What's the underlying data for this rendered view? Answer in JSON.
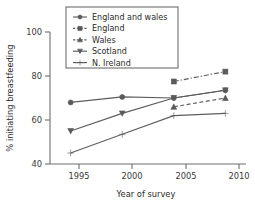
{
  "chart_data": {
    "type": "line",
    "title": "",
    "xlabel": "Year of survey",
    "ylabel": "% initiating breastfeeding",
    "x": [
      1995,
      2000,
      2005,
      2010
    ],
    "xticks": [
      "1995",
      "2000",
      "2005",
      "2010"
    ],
    "yticks": [
      "40",
      "60",
      "80",
      "100"
    ],
    "xlim": [
      1993,
      2012
    ],
    "ylim": [
      40,
      100
    ],
    "grid": false,
    "legend_position": "top-center",
    "series": [
      {
        "name": "England and wales",
        "marker": "circle",
        "linestyle": "solid",
        "color": "#5a5a5a",
        "x": [
          1995,
          2000,
          2005,
          2010
        ],
        "values": [
          68,
          70.5,
          70,
          73.5
        ]
      },
      {
        "name": "England",
        "marker": "square",
        "linestyle": "dashdot",
        "color": "#5a5a5a",
        "x": [
          2005,
          2010
        ],
        "values": [
          77.5,
          82
        ]
      },
      {
        "name": "Wales",
        "marker": "triangle-up",
        "linestyle": "dashed",
        "color": "#5a5a5a",
        "x": [
          2005,
          2010
        ],
        "values": [
          66,
          70
        ]
      },
      {
        "name": "Scotland",
        "marker": "triangle-down",
        "linestyle": "solid",
        "color": "#5a5a5a",
        "x": [
          1995,
          2000,
          2005,
          2010
        ],
        "values": [
          55,
          63,
          70,
          73.5
        ]
      },
      {
        "name": "N. Ireland",
        "marker": "plus",
        "linestyle": "solid",
        "color": "#5a5a5a",
        "x": [
          1995,
          2000,
          2005,
          2010
        ],
        "values": [
          45,
          53.5,
          62,
          63
        ]
      }
    ]
  },
  "axes": {
    "y_title": "% initiating breastfeeding",
    "x_title": "Year of survey",
    "y_tick_0": "100",
    "y_tick_1": "80",
    "y_tick_2": "60",
    "y_tick_3": "40",
    "x_tick_0": "1995",
    "x_tick_1": "2000",
    "x_tick_2": "2005",
    "x_tick_3": "2010"
  },
  "legend": {
    "entries": [
      {
        "label": "England and wales"
      },
      {
        "label": "England"
      },
      {
        "label": "Wales"
      },
      {
        "label": "Scotland"
      },
      {
        "label": "N. Ireland"
      }
    ]
  }
}
